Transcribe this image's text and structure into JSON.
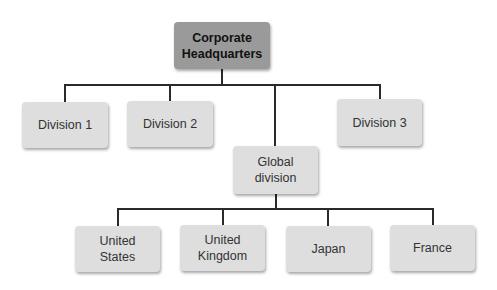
{
  "diagram": {
    "type": "org-chart",
    "root": {
      "label_line1": "Corporate",
      "label_line2": "Headquarters"
    },
    "divisions": [
      {
        "label": "Division 1"
      },
      {
        "label": "Division 2"
      },
      {
        "label": "Division 3"
      },
      {
        "label_line1": "Global",
        "label_line2": "division"
      }
    ],
    "global_children": [
      {
        "label_line1": "United",
        "label_line2": "States"
      },
      {
        "label_line1": "United",
        "label_line2": "Kingdom"
      },
      {
        "label": "Japan"
      },
      {
        "label": "France"
      }
    ],
    "colors": {
      "root_fill": "#9a9a9a",
      "box_fill": "#dedede",
      "line": "#2a2a2a"
    }
  }
}
